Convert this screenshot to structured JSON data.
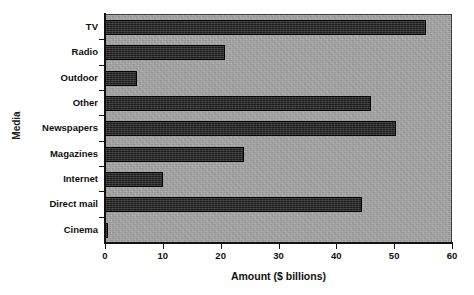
{
  "chart_data": {
    "type": "bar",
    "orientation": "horizontal",
    "title": "Bar Chart",
    "xlabel": "Amount ($ billions)",
    "ylabel": "Media",
    "xlim": [
      0,
      60
    ],
    "xticks": [
      "0",
      "10",
      "20",
      "30",
      "40",
      "50",
      "60"
    ],
    "grid": false,
    "legend": null,
    "plot_background_color": "#a8a8a8",
    "bar_color": "#2a2a2a",
    "categories": [
      "TV",
      "Radio",
      "Outdoor",
      "Other",
      "Newspapers",
      "Magazines",
      "Internet",
      "Direct mail",
      "Cinema"
    ],
    "values": [
      55.5,
      20.7,
      5.5,
      46.0,
      50.3,
      24.0,
      10.0,
      44.5,
      0.5
    ]
  }
}
